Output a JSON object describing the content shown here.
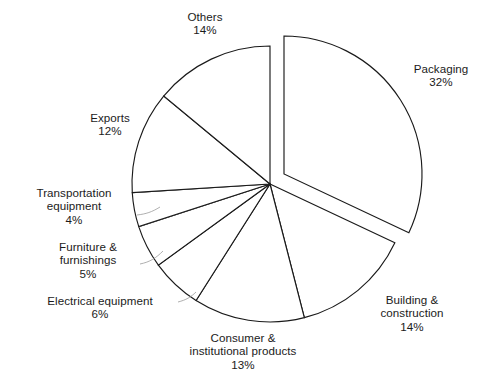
{
  "chart_data": {
    "type": "pie",
    "title": "",
    "subtitle": "",
    "xlabel": "",
    "ylabel": "",
    "legend_position": "none",
    "grid": false,
    "units": "percent",
    "exploded_slices": [
      "Packaging"
    ],
    "start_angle_deg": 0,
    "direction": "clockwise",
    "categories": [
      "Packaging",
      "Building & construction",
      "Consumer & institutional products",
      "Electrical equipment",
      "Furniture & furnishings",
      "Transportation equipment",
      "Exports",
      "Others"
    ],
    "values": [
      32,
      14,
      13,
      6,
      5,
      4,
      12,
      14
    ],
    "slices": [
      {
        "label": "Packaging",
        "label_line1": "Packaging",
        "label_line2": "",
        "percent": 32,
        "percent_text": "32%",
        "exploded": true
      },
      {
        "label": "Building & construction",
        "label_line1": "Building &",
        "label_line2": "construction",
        "percent": 14,
        "percent_text": "14%",
        "exploded": false
      },
      {
        "label": "Consumer & institutional products",
        "label_line1": "Consumer &",
        "label_line2": "institutional products",
        "percent": 13,
        "percent_text": "13%",
        "exploded": false
      },
      {
        "label": "Electrical equipment",
        "label_line1": "Electrical equipment",
        "label_line2": "",
        "percent": 6,
        "percent_text": "6%",
        "exploded": false
      },
      {
        "label": "Furniture & furnishings",
        "label_line1": "Furniture &",
        "label_line2": "furnishings",
        "percent": 5,
        "percent_text": "5%",
        "exploded": false
      },
      {
        "label": "Transportation equipment",
        "label_line1": "Transportation",
        "label_line2": "equipment",
        "percent": 4,
        "percent_text": "4%",
        "exploded": false
      },
      {
        "label": "Exports",
        "label_line1": "Exports",
        "label_line2": "",
        "percent": 12,
        "percent_text": "12%",
        "exploded": false
      },
      {
        "label": "Others",
        "label_line1": "Others",
        "label_line2": "",
        "percent": 14,
        "percent_text": "14%",
        "exploded": false
      }
    ]
  },
  "colors": {
    "background": "#ffffff",
    "slice_fill": "#ffffff",
    "slice_stroke": "#1a1a1a",
    "leader_line": "#9a9a9a",
    "text": "#1b1b1b"
  }
}
